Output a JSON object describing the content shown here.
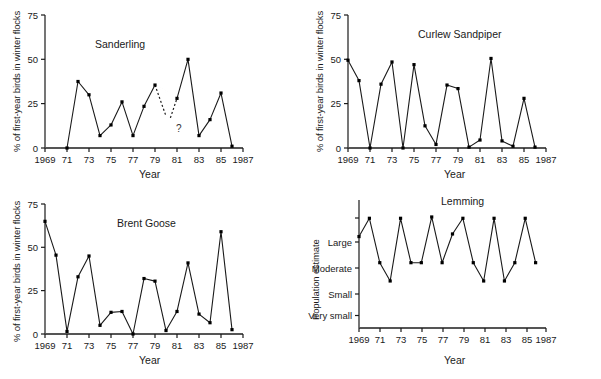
{
  "figure": {
    "background": "#ffffff",
    "line_color": "#1a1a1a",
    "marker_color": "#000000"
  },
  "labels": {
    "y_axis_percent": "% of first-year birds in winter flocks",
    "y_axis_population": "Population estimate",
    "x_axis": "Year",
    "uncertain_marker": "?"
  },
  "axes": {
    "x_ticks": [
      "1969",
      "71",
      "73",
      "75",
      "77",
      "79",
      "81",
      "83",
      "85",
      "1987"
    ],
    "x_tick_years": [
      1969,
      1971,
      1973,
      1975,
      1977,
      1979,
      1981,
      1983,
      1985,
      1987
    ],
    "y_ticks_percent": [
      "0",
      "25",
      "50",
      "75"
    ],
    "y_tick_values_percent": [
      0,
      25,
      50,
      75
    ],
    "y_ticks_category": [
      "Very small",
      "Small",
      "Moderate",
      "Large"
    ],
    "y_tick_values_category": [
      1,
      2,
      3,
      4
    ]
  },
  "chart_data": [
    {
      "type": "line",
      "title": "Sanderling",
      "xlabel": "Year",
      "ylabel": "% of first-year birds in winter flocks",
      "xlim": [
        1969,
        1987
      ],
      "ylim": [
        0,
        75
      ],
      "grid": false,
      "legend": "none",
      "x": [
        1971,
        1972,
        1973,
        1974,
        1975,
        1976,
        1977,
        1978,
        1979,
        1981,
        1982,
        1983,
        1984,
        1985,
        1986
      ],
      "values": [
        0,
        37.5,
        30,
        7,
        13,
        26,
        7,
        23.5,
        35.5,
        28,
        50,
        7,
        16,
        31,
        1
      ],
      "annotations": [
        {
          "text": "?",
          "x": 1980,
          "y": 10,
          "note": "data gap between 1979 and 1981"
        }
      ],
      "dashed_segments": [
        {
          "from_x": 1979,
          "from_y": 35.5,
          "to_x": 1980,
          "to_y": 18
        },
        {
          "from_x": 1980.4,
          "from_y": 17,
          "to_x": 1981,
          "to_y": 28
        }
      ]
    },
    {
      "type": "line",
      "title": "Curlew Sandpiper",
      "xlabel": "Year",
      "ylabel": "% of first-year birds in winter flocks",
      "xlim": [
        1969,
        1987
      ],
      "ylim": [
        0,
        75
      ],
      "grid": false,
      "legend": "none",
      "x": [
        1969,
        1970,
        1971,
        1972,
        1973,
        1974,
        1975,
        1976,
        1977,
        1978,
        1979,
        1980,
        1981,
        1982,
        1983,
        1984,
        1985,
        1986
      ],
      "values": [
        49.5,
        38,
        0,
        36,
        48.5,
        0,
        47,
        12.5,
        2,
        35.5,
        33.5,
        0.5,
        4.5,
        50.5,
        4,
        1,
        28,
        0.5
      ],
      "annotations": [],
      "dashed_segments": []
    },
    {
      "type": "line",
      "title": "Brent Goose",
      "xlabel": "Year",
      "ylabel": "% of first-year birds in winter flocks",
      "xlim": [
        1969,
        1987
      ],
      "ylim": [
        0,
        75
      ],
      "grid": false,
      "legend": "none",
      "x": [
        1969,
        1970,
        1971,
        1972,
        1973,
        1974,
        1975,
        1976,
        1977,
        1978,
        1979,
        1980,
        1981,
        1982,
        1983,
        1984,
        1985,
        1986
      ],
      "values": [
        65,
        45.5,
        1.5,
        33,
        45,
        5,
        12.5,
        13,
        0,
        32,
        30.5,
        2,
        13,
        41,
        11.5,
        6.5,
        59,
        2.5
      ],
      "annotations": [],
      "dashed_segments": []
    },
    {
      "type": "line",
      "title": "Lemming",
      "xlabel": "Year",
      "ylabel": "Population estimate",
      "xlim": [
        1969,
        1987
      ],
      "ylim": [
        0.5,
        5
      ],
      "grid": false,
      "legend": "none",
      "x": [
        1969,
        1970,
        1971,
        1972,
        1973,
        1974,
        1975,
        1976,
        1977,
        1978,
        1979,
        1980,
        1981,
        1982,
        1983,
        1984,
        1985,
        1986
      ],
      "values": [
        4.0,
        4.7,
        3.0,
        2.3,
        4.7,
        3.0,
        3.0,
        4.75,
        3.0,
        4.1,
        4.7,
        3.0,
        2.3,
        4.7,
        2.3,
        3.0,
        4.7,
        3.0
      ],
      "value_labels": [
        "Large",
        "",
        "Moderate",
        "Small",
        "",
        "Moderate",
        "Moderate",
        "",
        "Moderate",
        "",
        "",
        "Moderate",
        "Small",
        "",
        "Small",
        "Moderate",
        "",
        "Moderate"
      ],
      "annotations": [],
      "dashed_segments": []
    }
  ]
}
